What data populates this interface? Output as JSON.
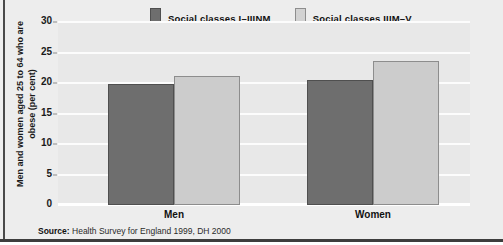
{
  "chart_data": {
    "type": "bar",
    "title": "",
    "subtitle": "",
    "xlabel": "",
    "ylabel": "Men and women aged 25 to 64 who are obese (per cent)",
    "categories": [
      "Men",
      "Women"
    ],
    "series": [
      {
        "name": "Social classes I–IIINM",
        "color": "#6e6e6e",
        "values": [
          19.7,
          20.4
        ]
      },
      {
        "name": "Social classes IIIM–V",
        "color": "#cccccc",
        "values": [
          21.0,
          23.5
        ]
      }
    ],
    "ylim": [
      0,
      30
    ],
    "yticks": [
      "0",
      "5",
      "10",
      "15",
      "20",
      "25",
      "30"
    ],
    "ytick_values": [
      0,
      5,
      10,
      15,
      20,
      25,
      30
    ],
    "grid": "horizontal",
    "legend_position": "top-center",
    "annotations": [
      "Source: Health Survey for England 1999, DH 2000"
    ]
  },
  "axis": {
    "y_title": "Men and women aged 25 to 64 who are obese (per cent)",
    "ticks": [
      {
        "label": "30",
        "value": 30
      },
      {
        "label": "25",
        "value": 25
      },
      {
        "label": "20",
        "value": 20
      },
      {
        "label": "15",
        "value": 15
      },
      {
        "label": "10",
        "value": 10
      },
      {
        "label": "5",
        "value": 5
      },
      {
        "label": "0",
        "value": 0
      }
    ]
  },
  "legend": {
    "items": [
      {
        "label": "Social classes I–IIINM",
        "swatch": "dark-swatch-icon",
        "color": "#6e6e6e"
      },
      {
        "label": "Social classes IIIM–V",
        "swatch": "light-swatch-icon",
        "color": "#cccccc"
      }
    ]
  },
  "groups": [
    {
      "label": "Men",
      "bars": [
        {
          "series": "Social classes I–IIINM",
          "value": 19.7,
          "tone": "dark"
        },
        {
          "series": "Social classes IIIM–V",
          "value": 21.0,
          "tone": "light"
        }
      ]
    },
    {
      "label": "Women",
      "bars": [
        {
          "series": "Social classes I–IIINM",
          "value": 20.4,
          "tone": "dark"
        },
        {
          "series": "Social classes IIIM–V",
          "value": 23.5,
          "tone": "light"
        }
      ]
    }
  ],
  "footer": {
    "source_prefix": "Source:",
    "source_text": " Health Survey for England 1999, DH 2000"
  },
  "colors": {
    "series_dark": "#6e6e6e",
    "series_light": "#cccccc",
    "background": "#ededed",
    "plot_background": "#e8e8e8",
    "gridline": "#fcfcfc",
    "frame": "#3d3d3d"
  }
}
